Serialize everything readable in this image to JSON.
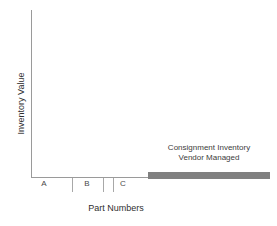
{
  "chart_data": {
    "type": "bar",
    "title": "",
    "xlabel": "Part Numbers",
    "ylabel": "Inventory Value",
    "categories": [
      "A",
      "B",
      "C",
      "Consignment"
    ],
    "values": [
      0,
      0,
      0,
      0
    ],
    "grid": false,
    "legend": false,
    "axis_ranges": {
      "x": [
        "A",
        "Consignment"
      ],
      "y": [
        0,
        100
      ]
    },
    "series": [
      {
        "name": "Inventory Value",
        "values": [
          0,
          0,
          0,
          0
        ]
      }
    ],
    "annotations": [
      {
        "name": "consignment-bar-label",
        "line1": "Consignment Inventory",
        "line2": "Vendor Managed",
        "attached_to": "Consignment"
      }
    ],
    "bar_color": "#808080",
    "axis_color": "#9a9a9a"
  },
  "axis": {
    "ylabel": "Inventory Value",
    "xlabel": "Part Numbers",
    "ticks": [
      "A",
      "B",
      "C"
    ]
  },
  "annotation": {
    "line1": "Consignment Inventory",
    "line2": "Vendor Managed"
  }
}
